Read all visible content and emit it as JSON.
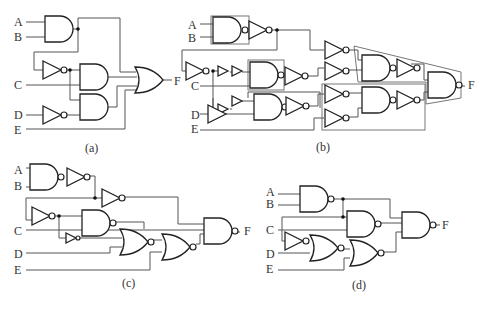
{
  "figure": {
    "panels": [
      {
        "id": "a",
        "caption": "(a)",
        "inputs": [
          "A",
          "B",
          "C",
          "D",
          "E"
        ],
        "output": "F",
        "gates": [
          "AND(A,B)",
          "NOT(C-feedback)",
          "NOT(D)",
          "AND",
          "AND",
          "OR4"
        ]
      },
      {
        "id": "b",
        "caption": "(b)",
        "inputs": [
          "A",
          "B",
          "C",
          "D",
          "E"
        ],
        "output": "F",
        "gates": [
          "NAND+NOT (boxed AND)",
          "NOT",
          "buffers",
          "NAND+NOT (boxed)",
          "NAND+NOT",
          "4x NOT",
          "2x NAND+NOT",
          "NAND (boxed OR)"
        ]
      },
      {
        "id": "c",
        "caption": "(c)",
        "inputs": [
          "A",
          "B",
          "C",
          "D",
          "E"
        ],
        "output": "F",
        "gates": [
          "NAND",
          "NOT",
          "NOT",
          "NOT",
          "NAND",
          "buffer",
          "NOR",
          "NOR",
          "NAND"
        ]
      },
      {
        "id": "d",
        "caption": "(d)",
        "inputs": [
          "A",
          "B",
          "C",
          "D",
          "E"
        ],
        "output": "F",
        "gates": [
          "NAND(A,B)",
          "NAND",
          "NOT",
          "NOR",
          "NOR",
          "NAND3"
        ]
      }
    ]
  },
  "labels": {
    "A": "A",
    "B": "B",
    "C": "C",
    "D": "D",
    "E": "E",
    "F": "F",
    "cap_a": "(a)",
    "cap_b": "(b)",
    "cap_c": "(c)",
    "cap_d": "(d)"
  }
}
